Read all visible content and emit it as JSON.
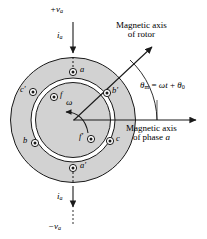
{
  "figure": {
    "type": "machine-cross-section",
    "colors": {
      "stator_fill": "#d2d2d2",
      "rotor_fill": "#d2d2d2",
      "airgap_fill": "#ffffff",
      "outline": "#1a1a1a",
      "background": "#ffffff"
    }
  },
  "terminals": {
    "top_voltage": "+v",
    "top_voltage_sub": "a",
    "top_current": "i",
    "top_current_sub": "a",
    "bottom_current": "i",
    "bottom_current_sub": "a",
    "bottom_voltage": "−v",
    "bottom_voltage_sub": "a"
  },
  "annotations": {
    "rotor_axis_line1": "Magnetic axis",
    "rotor_axis_line2": "of rotor",
    "phase_axis_line1": "Magnetic axis",
    "phase_axis_line2_pre": "of phase ",
    "phase_axis_line2_em": "a",
    "angle_symbol": "θ",
    "angle_sub": "m",
    "angle_eq": " = ",
    "angle_omega": "ω",
    "angle_t": "t",
    "angle_plus": " + ",
    "angle_theta0": "θ",
    "angle_theta0_sub": "0",
    "rotation_symbol": "ω"
  },
  "conductors": [
    {
      "id": "a",
      "label": "a",
      "marker": "dot",
      "x": 73,
      "y": 72,
      "lx": 80,
      "ly": 66
    },
    {
      "id": "a'",
      "label": "a′",
      "marker": "dot",
      "x": 73,
      "y": 168,
      "lx": 80,
      "ly": 162
    },
    {
      "id": "b",
      "label": "b",
      "marker": "dot",
      "x": 35,
      "y": 143,
      "lx": 23,
      "ly": 137
    },
    {
      "id": "b'",
      "label": "b′",
      "marker": "dot",
      "x": 107,
      "y": 93,
      "lx": 113,
      "ly": 87
    },
    {
      "id": "c",
      "label": "c",
      "marker": "dot",
      "x": 110,
      "y": 141,
      "lx": 117,
      "ly": 135
    },
    {
      "id": "c'",
      "label": "c′",
      "marker": "dot",
      "x": 33,
      "y": 92,
      "lx": 21,
      "ly": 86
    },
    {
      "id": "f",
      "label": "f",
      "marker": "dot",
      "x": 54,
      "y": 97,
      "lx": 61,
      "ly": 91
    },
    {
      "id": "f'",
      "label": "f′",
      "marker": "dot",
      "x": 91,
      "y": 139,
      "lx": 80,
      "ly": 133
    }
  ],
  "geometry": {
    "cx": 73,
    "cy": 120,
    "stator_outer_r": 63,
    "stator_inner_r": 42,
    "gap_outer_r": 42,
    "gap_inner_r": 38,
    "rotor_r": 38
  }
}
